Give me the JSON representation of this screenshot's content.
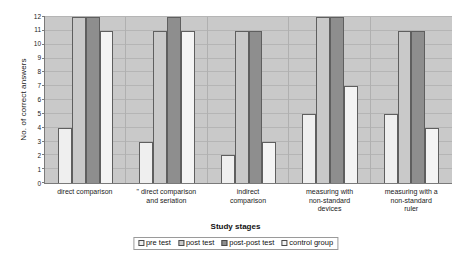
{
  "chart_data": {
    "type": "bar",
    "title": "",
    "xlabel": "Study stages",
    "ylabel": "No. of correct answers",
    "ylim": [
      0,
      12
    ],
    "yticks": [
      0,
      1,
      2,
      3,
      4,
      5,
      6,
      7,
      8,
      9,
      10,
      11,
      12
    ],
    "grid": true,
    "legend_position": "bottom",
    "categories": [
      "direct comparison",
      "\" direct comparison and seriation",
      "indirect comparison",
      "measuring with non-standard devices",
      "measuring with a non-standard ruler"
    ],
    "category_lines": [
      [
        "direct comparison"
      ],
      [
        "\" direct comparison",
        "and seriation"
      ],
      [
        "indirect",
        "comparison"
      ],
      [
        "measuring with",
        "non-standard",
        "devices"
      ],
      [
        "measuring with a",
        "non-standard",
        "ruler"
      ]
    ],
    "series": [
      {
        "name": "pre test",
        "color": "#efefef",
        "values": [
          4,
          3,
          2,
          5,
          5
        ]
      },
      {
        "name": "post test",
        "color": "#c9c9c9",
        "values": [
          12,
          11,
          11,
          12,
          11
        ]
      },
      {
        "name": "post-post test",
        "color": "#8e8e8e",
        "values": [
          12,
          12,
          11,
          12,
          11
        ]
      },
      {
        "name": "control group",
        "color": "#f4f4f4",
        "values": [
          11,
          11,
          3,
          7,
          4
        ]
      }
    ]
  },
  "legend": {
    "items": [
      {
        "label": "pre test",
        "color": "#efefef"
      },
      {
        "label": "post test",
        "color": "#c9c9c9"
      },
      {
        "label": "post-post test",
        "color": "#8e8e8e"
      },
      {
        "label": "control group",
        "color": "#f4f4f4"
      }
    ]
  }
}
